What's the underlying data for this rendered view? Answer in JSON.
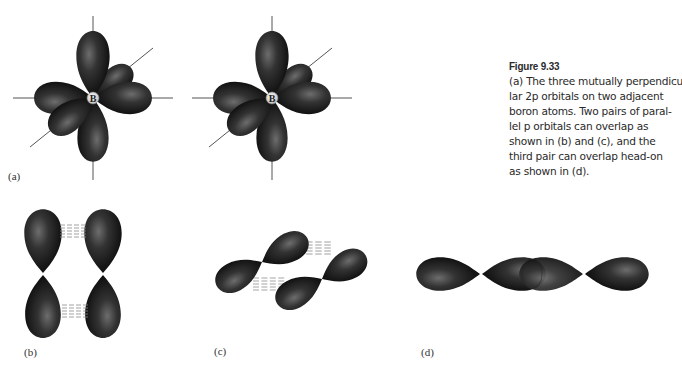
{
  "figure": {
    "title": "Figure 9.33",
    "caption_lines": [
      "(a) The three mutually perpendicu-",
      "lar 2p orbitals on two adjacent",
      "boron atoms. Two pairs of paral-",
      "lel p orbitals can overlap as",
      "shown in (b) and (c), and the",
      "third pair can overlap head-on",
      "as shown in (d)."
    ],
    "caption_text": "(a) The three mutually perpendicular 2p orbitals on two adjacent boron atoms. Two pairs of parallel p orbitals can overlap as shown in (b) and (c), and the third pair can overlap head-on as shown in (d).",
    "panels": [
      {
        "id": "a",
        "label": "(a)",
        "description": "Two boron atoms each with three mutually perpendicular 2p orbitals (px, py, pz)",
        "atom_label": "B"
      },
      {
        "id": "b",
        "label": "(b)",
        "description": "Side-by-side (pi) overlap of a pair of parallel vertical p orbitals"
      },
      {
        "id": "c",
        "label": "(c)",
        "description": "Side-by-side (pi) overlap of a pair of parallel tilted p orbitals"
      },
      {
        "id": "d",
        "label": "(d)",
        "description": "Head-on (sigma) overlap of the third pair of p orbitals"
      }
    ]
  },
  "colors": {
    "lobe_dark": "#111111",
    "lobe_highlight": "#6a6a6a",
    "axis_line": "#555555",
    "text": "#2a2a2a",
    "background": "#ffffff"
  }
}
